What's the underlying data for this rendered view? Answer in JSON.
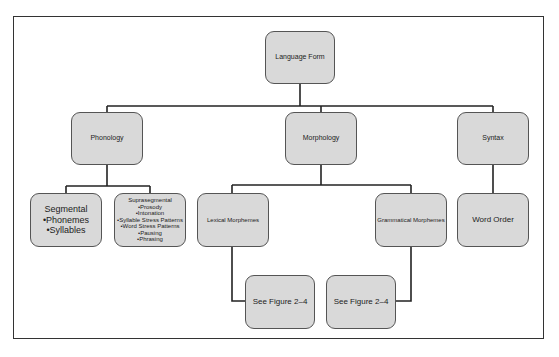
{
  "diagram": {
    "root": "Language Form",
    "level1": {
      "phonology": "Phonology",
      "morphology": "Morphology",
      "syntax": "Syntax"
    },
    "phonology_children": {
      "segmental": {
        "title": "Segmental",
        "items": [
          "•Phonemes",
          "•Syllables"
        ]
      },
      "suprasegmental": {
        "title": "Suprasegmental",
        "items": [
          "•Prosody",
          "•Intonation",
          "•Syllable Stress Patterns",
          "•Word Stress Patterns",
          "•Pausing",
          "•Phrasing"
        ]
      }
    },
    "morphology_children": {
      "lexical": "Lexical Morphemes",
      "grammatical": "Grammatical Morphemes"
    },
    "syntax_children": {
      "word_order": "Word Order"
    },
    "references": {
      "lexical_ref": "See Figure 2–4",
      "grammatical_ref": "See Figure 2–4"
    }
  }
}
